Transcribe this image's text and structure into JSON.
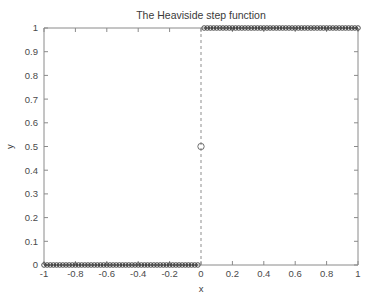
{
  "chart_data": {
    "type": "line",
    "title": "The Heaviside step function",
    "xlabel": "x",
    "ylabel": "y",
    "xlim": [
      -1,
      1
    ],
    "ylim": [
      0,
      1
    ],
    "grid": false,
    "legend": null,
    "xticks": [
      -1,
      -0.8,
      -0.6,
      -0.4,
      -0.2,
      0,
      0.2,
      0.4,
      0.6,
      0.8,
      1
    ],
    "xticklabels": [
      "-1",
      "-0.8",
      "-0.6",
      "-0.4",
      "-0.2",
      "0",
      "0.2",
      "0.4",
      "0.6",
      "0.8",
      "1"
    ],
    "yticks": [
      0,
      0.1,
      0.2,
      0.3,
      0.4,
      0.5,
      0.6,
      0.7,
      0.8,
      0.9,
      1
    ],
    "yticklabels": [
      "0",
      "0.1",
      "0.2",
      "0.3",
      "0.4",
      "0.5",
      "0.6",
      "0.7",
      "0.8",
      "0.9",
      "1"
    ],
    "marker": "circle",
    "line_color": "#3b3b3b",
    "series": [
      {
        "name": "H(x) = 0 for x < 0",
        "x": [
          -1,
          -0.98,
          -0.96,
          -0.94,
          -0.92,
          -0.9,
          -0.88,
          -0.86,
          -0.84,
          -0.82,
          -0.8,
          -0.78,
          -0.76,
          -0.74,
          -0.72,
          -0.7,
          -0.68,
          -0.66,
          -0.64,
          -0.62,
          -0.6,
          -0.58,
          -0.56,
          -0.54,
          -0.52,
          -0.5,
          -0.48,
          -0.46,
          -0.44,
          -0.42,
          -0.4,
          -0.38,
          -0.36,
          -0.34,
          -0.32,
          -0.3,
          -0.28,
          -0.26,
          -0.24,
          -0.22,
          -0.2,
          -0.18,
          -0.16,
          -0.14,
          -0.12,
          -0.1,
          -0.08,
          -0.06,
          -0.04,
          -0.02
        ],
        "values": [
          0,
          0,
          0,
          0,
          0,
          0,
          0,
          0,
          0,
          0,
          0,
          0,
          0,
          0,
          0,
          0,
          0,
          0,
          0,
          0,
          0,
          0,
          0,
          0,
          0,
          0,
          0,
          0,
          0,
          0,
          0,
          0,
          0,
          0,
          0,
          0,
          0,
          0,
          0,
          0,
          0,
          0,
          0,
          0,
          0,
          0,
          0,
          0,
          0,
          0
        ]
      },
      {
        "name": "H(x) = 1 for x > 0",
        "x": [
          0.02,
          0.04,
          0.06,
          0.08,
          0.1,
          0.12,
          0.14,
          0.16,
          0.18,
          0.2,
          0.22,
          0.24,
          0.26,
          0.28,
          0.3,
          0.32,
          0.34,
          0.36,
          0.38,
          0.4,
          0.42,
          0.44,
          0.46,
          0.48,
          0.5,
          0.52,
          0.54,
          0.56,
          0.58,
          0.6,
          0.62,
          0.64,
          0.66,
          0.68,
          0.7,
          0.72,
          0.74,
          0.76,
          0.78,
          0.8,
          0.82,
          0.84,
          0.86,
          0.88,
          0.9,
          0.92,
          0.94,
          0.96,
          0.98,
          1
        ],
        "values": [
          1,
          1,
          1,
          1,
          1,
          1,
          1,
          1,
          1,
          1,
          1,
          1,
          1,
          1,
          1,
          1,
          1,
          1,
          1,
          1,
          1,
          1,
          1,
          1,
          1,
          1,
          1,
          1,
          1,
          1,
          1,
          1,
          1,
          1,
          1,
          1,
          1,
          1,
          1,
          1,
          1,
          1,
          1,
          1,
          1,
          1,
          1,
          1,
          1,
          1
        ]
      }
    ],
    "annotations": [
      {
        "name": "discontinuity-point",
        "x": 0,
        "y": 0.5,
        "marker": "open-circle",
        "note": "H(0) = 0.5"
      },
      {
        "name": "discontinuity-jump",
        "x": 0,
        "y_from": 0,
        "y_to": 1,
        "style": "dashed-vertical"
      }
    ]
  }
}
